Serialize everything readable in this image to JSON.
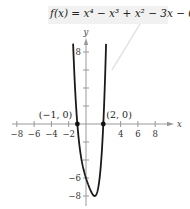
{
  "chart_data": {
    "type": "line",
    "title": "f(x) = x⁴ − x³ + x² − 3x − 6",
    "xlabel": "x",
    "ylabel": "y",
    "xlim": [
      -9,
      9.5
    ],
    "ylim": [
      -9,
      9.5
    ],
    "grid": false,
    "x_ticks": [
      -8,
      -6,
      -4,
      -2,
      4,
      6,
      8
    ],
    "y_ticks": [
      8,
      6,
      4,
      2,
      -2,
      -4,
      -6,
      -8
    ],
    "y_tick_labels_shown": [
      8,
      -6,
      -8
    ],
    "series": [
      {
        "name": "f(x) = x^4 - x^3 + x^2 - 3x - 6",
        "x": [
          -1.4,
          -1.35,
          -1.3,
          -1.2,
          -1.1,
          -1.0,
          -0.75,
          -0.5,
          -0.25,
          0.0,
          0.25,
          0.5,
          0.75,
          0.9,
          1.0,
          1.25,
          1.5,
          1.75,
          2.0,
          2.2,
          2.3,
          2.4
        ],
        "values": [
          6.9,
          5.65,
          4.5,
          2.84,
          1.34,
          0.0,
          -2.51,
          -4.06,
          -5.09,
          -6.0,
          -6.69,
          -7.31,
          -7.78,
          -7.94,
          -8.0,
          -7.66,
          -6.56,
          -4.26,
          0.0,
          4.54,
          8.2,
          11.9
        ]
      }
    ],
    "annotations": [
      {
        "label": "(−1, 0)",
        "x": -1,
        "y": 0
      },
      {
        "label": "(2, 0)",
        "x": 2,
        "y": 0
      }
    ]
  },
  "title_text": "f(x) = x⁴ − x³ + x² − 3x − 6"
}
